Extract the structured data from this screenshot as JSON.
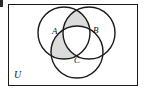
{
  "figure": {
    "kind": "venn-diagram",
    "universe_label": "U",
    "background_color": "#ffffff",
    "stroke_color": "#1a1a1a",
    "shade_color": "#dcdcdc"
  },
  "sets": [
    {
      "id": "A",
      "label": "A",
      "cx": 64,
      "cy": 33,
      "r": 26
    },
    {
      "id": "B",
      "label": "B",
      "cx": 89,
      "cy": 33,
      "r": 26
    },
    {
      "id": "C",
      "label": "C",
      "cx": 77,
      "cy": 52,
      "r": 26
    }
  ],
  "shaded_regions": [
    {
      "id": "A-inter-B",
      "label": "A ∩ B",
      "shaded": true
    },
    {
      "id": "A-inter-C",
      "label": "A ∩ C",
      "shaded": true
    },
    {
      "id": "B-inter-C",
      "label": "B ∩ C",
      "shaded": false
    },
    {
      "id": "A-inter-B-inter-C",
      "label": "A ∩ B ∩ C",
      "shaded": false
    }
  ],
  "labels": {
    "A": "A",
    "B": "B",
    "C": "C",
    "U": "U"
  }
}
